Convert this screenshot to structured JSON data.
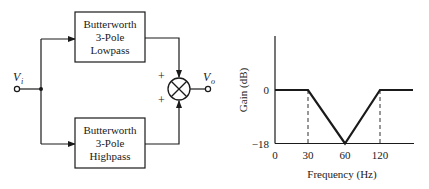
{
  "diagram": {
    "input_label": "V",
    "input_subscript": "i",
    "output_label": "V",
    "output_subscript": "o",
    "top_block": {
      "lines": [
        "Butterworth",
        "3-Pole",
        "Lowpass"
      ]
    },
    "bottom_block": {
      "lines": [
        "Butterworth",
        "3-Pole",
        "Highpass"
      ]
    },
    "summer": {
      "top_sign": "+",
      "bottom_sign": "+"
    }
  },
  "chart_data": {
    "type": "line",
    "title": "",
    "xlabel": "Frequency (Hz)",
    "ylabel": "Gain (dB)",
    "x_tick_labels": [
      "0",
      "30",
      "60",
      "120"
    ],
    "y_tick_labels": [
      "0",
      "−18"
    ],
    "y_ticks": [
      0,
      -18
    ],
    "ylim": [
      -18,
      14
    ],
    "grid": false,
    "series": [
      {
        "name": "Notch response",
        "points": [
          {
            "x_label": "0",
            "y": 0
          },
          {
            "x_label": "30",
            "y": 0
          },
          {
            "x_label": "60",
            "y": -18
          },
          {
            "x_label": "120",
            "y": 0
          },
          {
            "x_label": "end",
            "y": 0
          }
        ]
      }
    ],
    "reference_lines": [
      {
        "x_label": "30",
        "style": "dashed"
      },
      {
        "x_label": "120",
        "style": "dashed"
      }
    ]
  }
}
